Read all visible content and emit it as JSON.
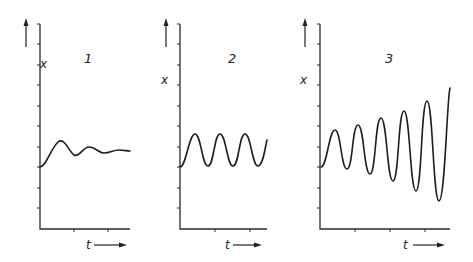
{
  "figure": {
    "colors": {
      "ink": "#222222",
      "background": "#ffffff"
    },
    "panels": [
      {
        "id": "1",
        "label": "1",
        "behavior": "damped oscillation",
        "y_axis_label": "x",
        "x_axis_label": "t",
        "axis_origin": [
          40,
          229
        ],
        "axis_top": 24,
        "axis_right": 130,
        "y_ticks": [
          24,
          44,
          65,
          85,
          106,
          126,
          147,
          167,
          188,
          208
        ],
        "x_ticks": [
          74,
          108
        ],
        "label_pos": [
          84,
          63
        ],
        "x_label_pos": [
          40,
          52
        ],
        "t_label_pos": [
          86,
          249
        ],
        "t_arrow": [
          94,
          127
        ],
        "y_arrow": [
          26,
          47,
          18
        ],
        "curve": "M40,167 C46,167 50,150 58,142 C64,137 68,150 74,155 C79,158 83,147 89,147 C95,147 99,153 104,153 C110,153 113,150 119,150 C124,150 127,151 130,151"
      },
      {
        "id": "2",
        "label": "2",
        "behavior": "sustained oscillation",
        "y_axis_label": "x",
        "x_axis_label": "t",
        "axis_origin": [
          180,
          229
        ],
        "axis_top": 24,
        "axis_right": 267,
        "y_ticks": [
          24,
          44,
          65,
          85,
          106,
          126,
          147,
          167,
          188,
          208
        ],
        "x_ticks": [
          215,
          250
        ],
        "label_pos": [
          228,
          63
        ],
        "x_label_pos": [
          161,
          68
        ],
        "t_label_pos": [
          225,
          249
        ],
        "t_arrow": [
          233,
          262
        ],
        "y_arrow": [
          166,
          47,
          18
        ],
        "curve": "M180,167 C186,167 189,134 195,134 C201,134 202,166 208,166 C214,166 214,134 220,134 C226,134 227,166 233,166 C239,166 239,134 245,134 C251,134 252,166 258,166 C263,166 265,148 267,140"
      },
      {
        "id": "3",
        "label": "3",
        "behavior": "growing (unstable) oscillation",
        "y_axis_label": "x",
        "x_axis_label": "t",
        "axis_origin": [
          320,
          229
        ],
        "axis_top": 24,
        "axis_right": 450,
        "y_ticks": [
          24,
          44,
          65,
          85,
          106,
          126,
          147,
          167,
          188,
          208
        ],
        "x_ticks": [
          355,
          390,
          425
        ],
        "label_pos": [
          385,
          63
        ],
        "x_label_pos": [
          300,
          68
        ],
        "t_label_pos": [
          403,
          249
        ],
        "t_arrow": [
          413,
          445
        ],
        "y_arrow": [
          305,
          47,
          18
        ],
        "curve": "M321,167 C327,167 329,130 335,130 C341,130 341,169 347,169 C353,169 352,125 358,125 C364,125 364,174 370,174 C376,174 375,118 381,118 C387,118 387,181 393,181 C399,181 398,111 404,111 C410,111 410,191 416,191 C422,191 421,101 427,101 C433,101 433,201 439,201 C445,201 447,98 450,88"
      }
    ]
  }
}
